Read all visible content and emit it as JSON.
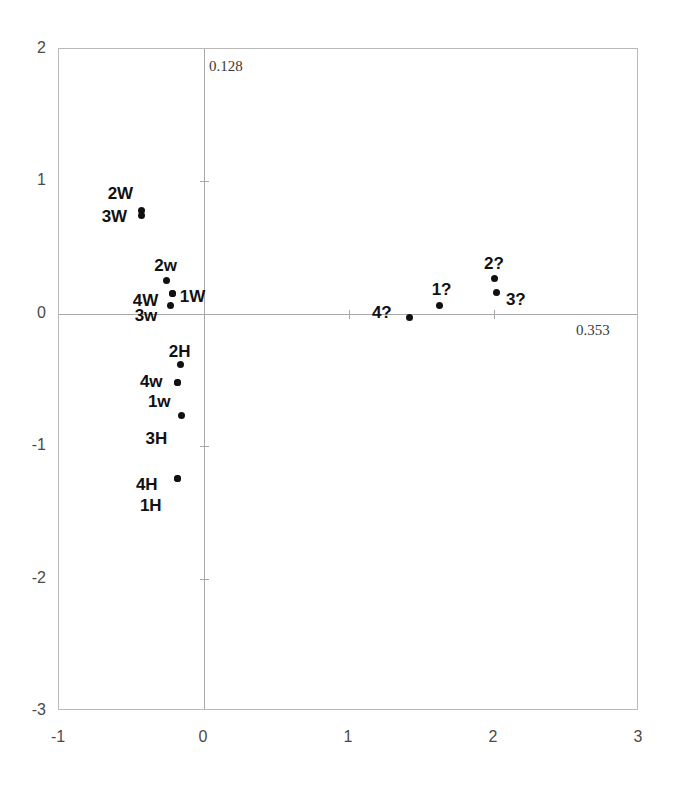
{
  "chart_data": {
    "type": "scatter",
    "title": "",
    "xlabel": "",
    "ylabel": "",
    "xlim": [
      -1,
      3
    ],
    "ylim": [
      -3,
      2
    ],
    "grid": false,
    "legend": null,
    "xticks": [
      "-1",
      "0",
      "1",
      "2",
      "3"
    ],
    "xtick_values": [
      -1,
      0,
      1,
      2,
      3
    ],
    "yticks": [
      "2",
      "1",
      "0",
      "-1",
      "-2",
      "-3"
    ],
    "ytick_values": [
      2,
      1,
      0,
      -1,
      -2,
      -3
    ],
    "axis_annotations": {
      "vertical_axis_inertia": "0.128",
      "horizontal_axis_inertia": "0.353"
    },
    "points": [
      {
        "label": "2W",
        "x": -0.43,
        "y": 0.78,
        "label_dx": -34,
        "label_dy": -26
      },
      {
        "label": "3W",
        "x": -0.43,
        "y": 0.74,
        "label_dx": -40,
        "label_dy": -8
      },
      {
        "label": "2w",
        "x": -0.26,
        "y": 0.25,
        "label_dx": -12,
        "label_dy": -24
      },
      {
        "label": "4W",
        "x": -0.215,
        "y": 0.15,
        "label_dx": -40,
        "label_dy": -2
      },
      {
        "label": "1W",
        "x": -0.215,
        "y": 0.15,
        "label_dx": 7,
        "label_dy": -6
      },
      {
        "label": "3w",
        "x": -0.23,
        "y": 0.06,
        "label_dx": -36,
        "label_dy": 1
      },
      {
        "label": "2H",
        "x": -0.16,
        "y": -0.385,
        "label_dx": -12,
        "label_dy": -22
      },
      {
        "label": "4w",
        "x": -0.18,
        "y": -0.52,
        "label_dx": -38,
        "label_dy": -10
      },
      {
        "label": "1w",
        "x": -0.18,
        "y": -0.52,
        "label_dx": -30,
        "label_dy": 10
      },
      {
        "label": "3H",
        "x": -0.155,
        "y": -0.77,
        "label_dx": -36,
        "label_dy": 14
      },
      {
        "label": "4H",
        "x": -0.18,
        "y": -1.245,
        "label_dx": -42,
        "label_dy": -3
      },
      {
        "label": "1H",
        "x": -0.18,
        "y": -1.245,
        "label_dx": -38,
        "label_dy": 18
      },
      {
        "label": "4?",
        "x": 1.42,
        "y": -0.03,
        "label_dx": -38,
        "label_dy": -14
      },
      {
        "label": "1?",
        "x": 1.625,
        "y": 0.065,
        "label_dx": -8,
        "label_dy": -24
      },
      {
        "label": "2?",
        "x": 2.0,
        "y": 0.265,
        "label_dx": -10,
        "label_dy": -24
      },
      {
        "label": "3?",
        "x": 2.02,
        "y": 0.16,
        "label_dx": 9,
        "label_dy": -2
      }
    ]
  }
}
